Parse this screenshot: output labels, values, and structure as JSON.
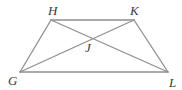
{
  "figure": {
    "type": "geometry-diagram",
    "shape_name": "trapezoid",
    "background_color": "#ffffff",
    "stroke_color": "#8f8f8f",
    "stroke_width": 1.3,
    "label_color": "#3b3b3b",
    "vertices": [
      {
        "id": "H",
        "label": "H",
        "x": 51,
        "y": 20,
        "label_x": 48,
        "label_y": 15
      },
      {
        "id": "K",
        "label": "K",
        "x": 134,
        "y": 20,
        "label_x": 130,
        "label_y": 15
      },
      {
        "id": "G",
        "label": "G",
        "x": 20,
        "y": 72,
        "label_x": 8,
        "label_y": 85
      },
      {
        "id": "L",
        "label": "L",
        "x": 168,
        "y": 72,
        "label_x": 169,
        "label_y": 87
      },
      {
        "id": "J",
        "label": "J",
        "x": 88,
        "y": 35,
        "label_x": 85,
        "label_y": 52
      }
    ],
    "segments": [
      {
        "id": "HK",
        "from": "H",
        "to": "K",
        "role": "top-side"
      },
      {
        "id": "GL",
        "from": "G",
        "to": "L",
        "role": "bottom-side"
      },
      {
        "id": "GH",
        "from": "G",
        "to": "H",
        "role": "left-side"
      },
      {
        "id": "KL",
        "from": "K",
        "to": "L",
        "role": "right-side"
      },
      {
        "id": "GK",
        "from": "G",
        "to": "K",
        "role": "diagonal"
      },
      {
        "id": "HL",
        "from": "H",
        "to": "L",
        "role": "diagonal"
      }
    ],
    "intersection_point": "J"
  }
}
